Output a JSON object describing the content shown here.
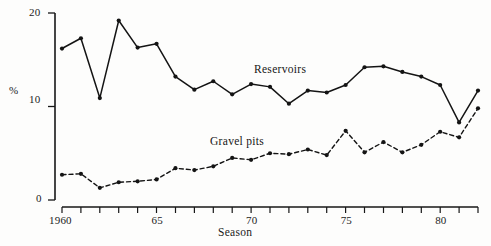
{
  "chart_data": {
    "type": "line",
    "title": "",
    "subtitle": "",
    "xlabel": "Season",
    "ylabel": "%",
    "grid": false,
    "legend_position": "inline-annotation",
    "x": [
      1960,
      1961,
      1962,
      1963,
      1964,
      1965,
      1966,
      1967,
      1968,
      1969,
      1970,
      1971,
      1972,
      1973,
      1974,
      1975,
      1976,
      1977,
      1978,
      1979,
      1980,
      1981,
      1982
    ],
    "xlim": [
      1960,
      1982
    ],
    "ylim": [
      0,
      20
    ],
    "yticks": [
      0,
      10,
      20
    ],
    "ytick_labels": [
      "0",
      "10",
      "20"
    ],
    "xtick_labels_shown": [
      "1960",
      "65",
      "70",
      "75",
      "80"
    ],
    "xtick_labels_shown_values": [
      1960,
      1965,
      1970,
      1975,
      1980
    ],
    "series": [
      {
        "name": "Reservoirs",
        "style": "solid",
        "marker": "filled-circle",
        "color": "#141414",
        "values": [
          16.2,
          17.3,
          10.9,
          19.2,
          16.3,
          16.7,
          13.2,
          11.8,
          12.7,
          11.3,
          12.4,
          12.1,
          10.3,
          11.7,
          11.5,
          12.3,
          14.2,
          14.3,
          13.7,
          13.2,
          12.3,
          8.3,
          11.7
        ]
      },
      {
        "name": "Gravel pits",
        "style": "dashed",
        "marker": "filled-circle",
        "color": "#141414",
        "values": [
          2.7,
          2.8,
          1.3,
          1.9,
          2.0,
          2.2,
          3.4,
          3.2,
          3.6,
          4.5,
          4.3,
          5.0,
          4.9,
          5.4,
          4.8,
          7.4,
          5.1,
          6.2,
          5.1,
          5.9,
          7.3,
          6.7,
          9.8
        ]
      }
    ]
  },
  "axes": {
    "y_axis_label": "%",
    "x_axis_label": "Season",
    "y_tick_20": "20",
    "y_tick_10": "10",
    "y_tick_0": "0",
    "x_tick_1960": "1960",
    "x_tick_1965": "65",
    "x_tick_1970": "70",
    "x_tick_1975": "75",
    "x_tick_1980": "80"
  },
  "annotations": {
    "reservoirs_label": "Reservoirs",
    "gravel_pits_label": "Gravel pits"
  }
}
